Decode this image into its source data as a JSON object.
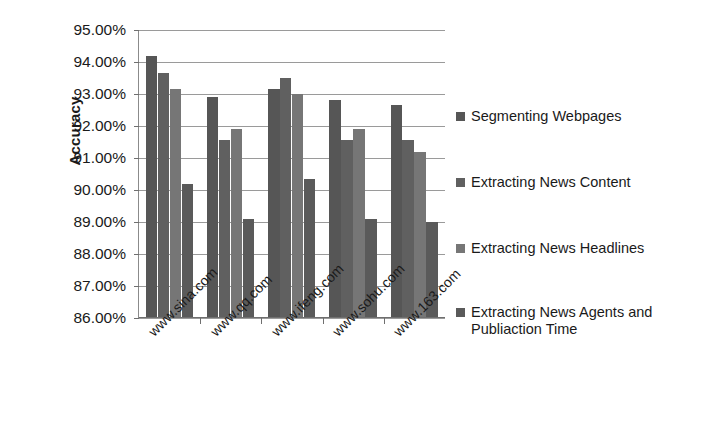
{
  "chart_data": {
    "type": "bar",
    "title": "",
    "xlabel": "",
    "ylabel": "Accuracy",
    "ylim": [
      86.0,
      95.0
    ],
    "ytick_step": 1.0,
    "ytick_labels": [
      "95.00%",
      "94.00%",
      "93.00%",
      "92.00%",
      "91.00%",
      "90.00%",
      "89.00%",
      "88.00%",
      "87.00%",
      "86.00%"
    ],
    "ytick_values": [
      95.0,
      94.0,
      93.0,
      92.0,
      91.0,
      90.0,
      89.0,
      88.0,
      87.0,
      86.0
    ],
    "grid": true,
    "legend_position": "right",
    "categories": [
      "www.sina.com",
      "www.qq.com",
      "www.ifeng.com",
      "www.sohu.com",
      "www.163.com"
    ],
    "series": [
      {
        "name": "Segmenting Webpages",
        "color": "#565656",
        "values": [
          94.2,
          92.9,
          93.15,
          92.8,
          92.65
        ]
      },
      {
        "name": "Extracting News Content",
        "color": "#606060",
        "values": [
          93.65,
          91.55,
          93.5,
          91.55,
          91.55
        ]
      },
      {
        "name": "Extracting News Headlines",
        "color": "#767676",
        "values": [
          93.15,
          91.9,
          93.0,
          91.9,
          91.2
        ]
      },
      {
        "name": "Extracting News Agents and Publiaction Time",
        "color": "#5a5a5a",
        "values": [
          90.2,
          89.1,
          90.35,
          89.1,
          89.0
        ]
      }
    ]
  },
  "legend": {
    "items": [
      {
        "label": "Segmenting Webpages"
      },
      {
        "label": "Extracting News Content"
      },
      {
        "label": "Extracting News Headlines"
      },
      {
        "label": "Extracting News Agents and Publiaction Time"
      }
    ]
  }
}
